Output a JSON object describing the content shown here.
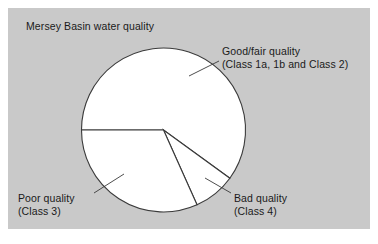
{
  "figure": {
    "title": "Mersey Basin water quality",
    "panel_color": "#c9c9c9",
    "background_color": "#ffffff",
    "slice_fill_color": "#ffffff",
    "outline_color": "#3a3a3a"
  },
  "callouts": {
    "good": {
      "line1": "Good/fair quality",
      "line2": "(Class 1a, 1b and Class 2)"
    },
    "poor": {
      "line1": "Poor quality",
      "line2": "(Class 3)"
    },
    "bad": {
      "line1": "Bad quality",
      "line2": "(Class 4)"
    }
  },
  "chart_data": {
    "type": "pie",
    "title": "Mersey Basin water quality",
    "labels": [
      "Good/fair quality (Class 1a, 1b and Class 2)",
      "Bad quality (Class 4)",
      "Poor quality (Class 3)"
    ],
    "short_labels": [
      "Good/fair quality",
      "Bad quality",
      "Poor quality"
    ],
    "sublabels": [
      "(Class 1a, 1b and Class 2)",
      "(Class 4)",
      "(Class 3)"
    ],
    "values": [
      60.0,
      8.3,
      31.7
    ],
    "units": "percent",
    "start_angle_deg": 270,
    "direction": "clockwise",
    "slice_angles_deg": [
      216,
      30,
      114
    ],
    "colors": [
      "#ffffff",
      "#ffffff",
      "#ffffff"
    ],
    "legend": "none",
    "grid": false,
    "xlabel": "",
    "ylabel": ""
  }
}
